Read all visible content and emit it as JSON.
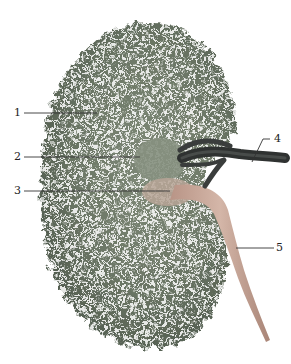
{
  "figure": {
    "colors": {
      "parenchyma": "#6f7a6a",
      "parenchyma_dark": "#4f5a4c",
      "vessel": "#3a3d3c",
      "ureter": "#c9a99a",
      "line": "#333333"
    }
  },
  "labels": [
    {
      "number": "1",
      "x": 14,
      "y": 110
    },
    {
      "number": "2",
      "x": 14,
      "y": 153
    },
    {
      "number": "3",
      "x": 14,
      "y": 187
    },
    {
      "number": "4",
      "x": 276,
      "y": 137
    },
    {
      "number": "5",
      "x": 277,
      "y": 245
    }
  ]
}
